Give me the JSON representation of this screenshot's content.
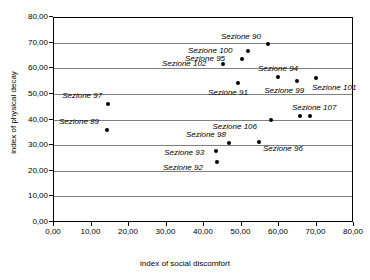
{
  "chart_data": {
    "type": "scatter",
    "title": "",
    "xlabel": "index of social discomfort",
    "ylabel": "index of physical decay",
    "xlim": [
      0,
      80
    ],
    "ylim": [
      0,
      80
    ],
    "xticks": [
      "0,00",
      "10,00",
      "20,00",
      "30,00",
      "40,00",
      "50,00",
      "60,00",
      "70,00",
      "80,00"
    ],
    "yticks": [
      "0,00",
      "10,00",
      "20,00",
      "30,00",
      "40,00",
      "50,00",
      "60,00",
      "70,00",
      "80,00"
    ],
    "grid": "horizontal",
    "legend": "none",
    "decimal_separator": ",",
    "points": [
      {
        "label": "Sezione 97",
        "x": 14.7,
        "y": 46.0,
        "label_dx": -46,
        "label_dy": -13
      },
      {
        "label": "Sezione 89",
        "x": 14.4,
        "y": 35.9,
        "label_dx": -48,
        "label_dy": -13
      },
      {
        "label": "Sezione 90",
        "x": 57.3,
        "y": 69.5,
        "label_dx": -47,
        "label_dy": -12
      },
      {
        "label": "Sezione 100",
        "x": 52.0,
        "y": 66.7,
        "label_dx": -60,
        "label_dy": -5
      },
      {
        "label": "Sezione 95",
        "x": 50.4,
        "y": 63.6,
        "label_dx": -57,
        "label_dy": -5
      },
      {
        "label": "Sezione 102",
        "x": 45.3,
        "y": 61.7,
        "label_dx": -61,
        "label_dy": -5
      },
      {
        "label": "Sezione 91",
        "x": 49.3,
        "y": 54.2,
        "label_dx": -30,
        "label_dy": 5
      },
      {
        "label": "Sezione 94",
        "x": 60.0,
        "y": 56.6,
        "label_dx": -20,
        "label_dy": -13
      },
      {
        "label": "Sezione 99",
        "x": 65.1,
        "y": 55.0,
        "label_dx": -33,
        "label_dy": 5
      },
      {
        "label": "Sezione 101",
        "x": 70.1,
        "y": 56.2,
        "label_dx": -4,
        "label_dy": 5
      },
      {
        "label": "Sezione 107",
        "x": 68.5,
        "y": 41.4,
        "label_dx": -18,
        "label_dy": -13
      },
      {
        "label": "",
        "x": 65.9,
        "y": 41.4,
        "label_dx": 0,
        "label_dy": 0
      },
      {
        "label": "Sezione 106",
        "x": 58.0,
        "y": 40.0,
        "label_dx": -58,
        "label_dy": 2
      },
      {
        "label": "Sezione 98",
        "x": 46.9,
        "y": 30.8,
        "label_dx": -43,
        "label_dy": -13
      },
      {
        "label": "Sezione 96",
        "x": 54.9,
        "y": 31.2,
        "label_dx": 4,
        "label_dy": 2
      },
      {
        "label": "Sezione 93",
        "x": 43.5,
        "y": 27.7,
        "label_dx": -52,
        "label_dy": -3
      },
      {
        "label": "Sezione 92",
        "x": 43.7,
        "y": 23.4,
        "label_dx": -54,
        "label_dy": 1
      }
    ]
  }
}
